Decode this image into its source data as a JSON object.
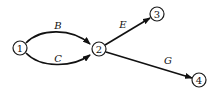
{
  "diagram": {
    "type": "directed-graph",
    "nodes": [
      {
        "id": "1",
        "label": "1",
        "x": 20,
        "y": 48
      },
      {
        "id": "2",
        "label": "2",
        "x": 99,
        "y": 49
      },
      {
        "id": "3",
        "label": "3",
        "x": 157,
        "y": 14
      },
      {
        "id": "4",
        "label": "4",
        "x": 199,
        "y": 80
      }
    ],
    "edges": [
      {
        "id": "B",
        "label": "B",
        "from": "1",
        "to": "2",
        "shape": "arc-up"
      },
      {
        "id": "C",
        "label": "C",
        "from": "1",
        "to": "2",
        "shape": "arc-down"
      },
      {
        "id": "E",
        "label": "E",
        "from": "2",
        "to": "3",
        "shape": "straight"
      },
      {
        "id": "G",
        "label": "G",
        "from": "2",
        "to": "4",
        "shape": "straight"
      }
    ]
  },
  "colors": {
    "stroke": "#111111",
    "background": "#ffffff"
  }
}
